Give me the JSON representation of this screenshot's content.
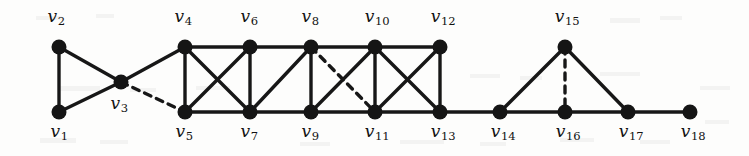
{
  "figure": {
    "kind": "undirected-graph-diagram",
    "width": 749,
    "height": 156,
    "background_color": "#fdfdfc",
    "node_color": "#151515",
    "edge_color": "#171717",
    "node_radius": 7.5,
    "solid_edge_width": 3.4,
    "dashed_edge_width": 3.4,
    "dash_pattern": "7,6"
  },
  "nodes": [
    {
      "id": "v1",
      "label": "v",
      "sub": "1",
      "x": 59,
      "y": 112,
      "label_x": 59,
      "label_y": 123
    },
    {
      "id": "v2",
      "label": "v",
      "sub": "2",
      "x": 59,
      "y": 47,
      "label_x": 56,
      "label_y": 8
    },
    {
      "id": "v3",
      "label": "v",
      "sub": "3",
      "x": 121,
      "y": 82,
      "label_x": 119,
      "label_y": 95
    },
    {
      "id": "v4",
      "label": "v",
      "sub": "4",
      "x": 185,
      "y": 47,
      "label_x": 183,
      "label_y": 8
    },
    {
      "id": "v5",
      "label": "v",
      "sub": "5",
      "x": 185,
      "y": 112,
      "label_x": 184,
      "label_y": 123
    },
    {
      "id": "v6",
      "label": "v",
      "sub": "6",
      "x": 250,
      "y": 47,
      "label_x": 249,
      "label_y": 8
    },
    {
      "id": "v7",
      "label": "v",
      "sub": "7",
      "x": 250,
      "y": 112,
      "label_x": 249,
      "label_y": 123
    },
    {
      "id": "v8",
      "label": "v",
      "sub": "8",
      "x": 311,
      "y": 47,
      "label_x": 310,
      "label_y": 8
    },
    {
      "id": "v9",
      "label": "v",
      "sub": "9",
      "x": 311,
      "y": 112,
      "label_x": 310,
      "label_y": 123
    },
    {
      "id": "v10",
      "label": "v",
      "sub": "10",
      "x": 375,
      "y": 47,
      "label_x": 377,
      "label_y": 8
    },
    {
      "id": "v11",
      "label": "v",
      "sub": "11",
      "x": 375,
      "y": 112,
      "label_x": 377,
      "label_y": 123
    },
    {
      "id": "v12",
      "label": "v",
      "sub": "12",
      "x": 440,
      "y": 47,
      "label_x": 443,
      "label_y": 8
    },
    {
      "id": "v13",
      "label": "v",
      "sub": "13",
      "x": 440,
      "y": 112,
      "label_x": 443,
      "label_y": 123
    },
    {
      "id": "v14",
      "label": "v",
      "sub": "14",
      "x": 500,
      "y": 112,
      "label_x": 503,
      "label_y": 123
    },
    {
      "id": "v15",
      "label": "v",
      "sub": "15",
      "x": 565,
      "y": 47,
      "label_x": 567,
      "label_y": 8
    },
    {
      "id": "v16",
      "label": "v",
      "sub": "16",
      "x": 565,
      "y": 112,
      "label_x": 568,
      "label_y": 123
    },
    {
      "id": "v17",
      "label": "v",
      "sub": "17",
      "x": 628,
      "y": 112,
      "label_x": 631,
      "label_y": 123
    },
    {
      "id": "v18",
      "label": "v",
      "sub": "18",
      "x": 690,
      "y": 112,
      "label_x": 693,
      "label_y": 123
    }
  ],
  "edges": [
    {
      "from": "v1",
      "to": "v2",
      "style": "solid"
    },
    {
      "from": "v1",
      "to": "v3",
      "style": "solid"
    },
    {
      "from": "v2",
      "to": "v3",
      "style": "solid"
    },
    {
      "from": "v3",
      "to": "v4",
      "style": "solid"
    },
    {
      "from": "v3",
      "to": "v5",
      "style": "dashed"
    },
    {
      "from": "v4",
      "to": "v5",
      "style": "solid"
    },
    {
      "from": "v4",
      "to": "v6",
      "style": "solid"
    },
    {
      "from": "v4",
      "to": "v7",
      "style": "solid"
    },
    {
      "from": "v5",
      "to": "v6",
      "style": "solid"
    },
    {
      "from": "v5",
      "to": "v7",
      "style": "solid"
    },
    {
      "from": "v6",
      "to": "v7",
      "style": "solid"
    },
    {
      "from": "v6",
      "to": "v8",
      "style": "solid"
    },
    {
      "from": "v7",
      "to": "v8",
      "style": "solid"
    },
    {
      "from": "v7",
      "to": "v9",
      "style": "solid"
    },
    {
      "from": "v8",
      "to": "v9",
      "style": "solid"
    },
    {
      "from": "v8",
      "to": "v10",
      "style": "solid"
    },
    {
      "from": "v8",
      "to": "v11",
      "style": "dashed"
    },
    {
      "from": "v9",
      "to": "v10",
      "style": "solid"
    },
    {
      "from": "v9",
      "to": "v11",
      "style": "solid"
    },
    {
      "from": "v10",
      "to": "v11",
      "style": "solid"
    },
    {
      "from": "v10",
      "to": "v12",
      "style": "solid"
    },
    {
      "from": "v10",
      "to": "v13",
      "style": "solid"
    },
    {
      "from": "v11",
      "to": "v12",
      "style": "solid"
    },
    {
      "from": "v11",
      "to": "v13",
      "style": "solid"
    },
    {
      "from": "v12",
      "to": "v13",
      "style": "solid"
    },
    {
      "from": "v13",
      "to": "v14",
      "style": "solid"
    },
    {
      "from": "v14",
      "to": "v15",
      "style": "solid"
    },
    {
      "from": "v14",
      "to": "v16",
      "style": "solid"
    },
    {
      "from": "v15",
      "to": "v16",
      "style": "dashed"
    },
    {
      "from": "v15",
      "to": "v17",
      "style": "solid"
    },
    {
      "from": "v16",
      "to": "v17",
      "style": "solid"
    },
    {
      "from": "v17",
      "to": "v18",
      "style": "solid"
    }
  ]
}
